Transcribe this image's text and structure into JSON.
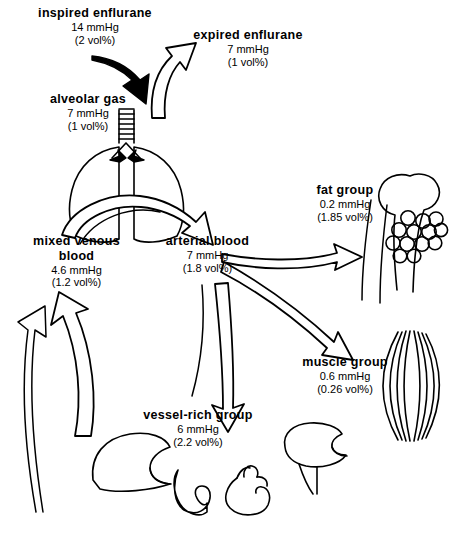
{
  "diagram": {
    "nodes": [
      {
        "id": "inspired",
        "name": "inspired  enflurane",
        "pressure": "14 mmHg",
        "volume": "(2 vol%)",
        "x": 10,
        "y": 6,
        "w": 170
      },
      {
        "id": "expired",
        "name": "expired  enflurane",
        "pressure": "7 mmHg",
        "volume": "(1 vol%)",
        "x": 168,
        "y": 28,
        "w": 160
      },
      {
        "id": "alveolar",
        "name": "alveolar  gas",
        "pressure": "7 mmHg",
        "volume": "(1 vol%)",
        "x": 18,
        "y": 92,
        "w": 140
      },
      {
        "id": "fat",
        "name": "fat group",
        "pressure": "0.2 mmHg",
        "volume": "(1.85 vol%)",
        "x": 285,
        "y": 183,
        "w": 120
      },
      {
        "id": "mixedvenous",
        "name": "mixed  venous\nblood",
        "pressure": "4.6 mmHg",
        "volume": "(1.2  vol%)",
        "x": 14,
        "y": 234,
        "w": 125
      },
      {
        "id": "arterial",
        "name": "arterial  blood",
        "pressure": "7 mmHg",
        "volume": "(1.8 vol%)",
        "x": 140,
        "y": 234,
        "w": 135
      },
      {
        "id": "muscle",
        "name": "muscle  group",
        "pressure": "0.6 mmHg",
        "volume": "(0.26 vol%)",
        "x": 280,
        "y": 355,
        "w": 130
      },
      {
        "id": "vesselrich",
        "name": "vessel-rich  group",
        "pressure": "6 mmHg",
        "volume": "(2.2 vol%)",
        "x": 118,
        "y": 408,
        "w": 160
      }
    ],
    "organs": [
      {
        "id": "lung",
        "label": "lung-illustration"
      },
      {
        "id": "bone",
        "label": "femur-bone-illustration"
      },
      {
        "id": "fatcells",
        "label": "adipose-cells-illustration"
      },
      {
        "id": "muscle",
        "label": "muscle-fiber-illustration"
      },
      {
        "id": "liver",
        "label": "liver-illustration"
      },
      {
        "id": "kidney",
        "label": "kidney-illustration"
      },
      {
        "id": "heart",
        "label": "heart-illustration"
      },
      {
        "id": "brain",
        "label": "brain-illustration"
      }
    ],
    "flows": [
      {
        "id": "inspired-to-alveolar",
        "from": "inspired",
        "to": "alveolar",
        "style": "hollow-arrow"
      },
      {
        "id": "alveolar-to-expired",
        "from": "alveolar",
        "to": "expired",
        "style": "hollow-arrow"
      },
      {
        "id": "lung-to-arterial",
        "from": "alveolar",
        "to": "arterial",
        "style": "hollow-arrow"
      },
      {
        "id": "arterial-to-fat",
        "from": "arterial",
        "to": "fat",
        "style": "hollow-arrow"
      },
      {
        "id": "arterial-to-muscle",
        "from": "arterial",
        "to": "muscle",
        "style": "hollow-arrow"
      },
      {
        "id": "arterial-to-vesselrich",
        "from": "arterial",
        "to": "vesselrich",
        "style": "hollow-arrow"
      },
      {
        "id": "tissues-to-mixedvenous",
        "from": "vesselrich",
        "to": "mixedvenous",
        "style": "hollow-arrow"
      },
      {
        "id": "mixedvenous-to-lung",
        "from": "mixedvenous",
        "to": "alveolar",
        "style": "line"
      }
    ],
    "colors": {
      "ink": "#000000",
      "background": "#ffffff"
    }
  }
}
